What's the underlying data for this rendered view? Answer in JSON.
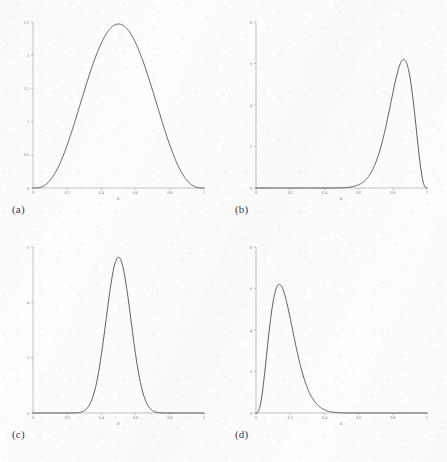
{
  "figure": {
    "background_color": "#fdfdfd",
    "curve_color": "#3c3c3c",
    "axis_color": "#9a9a9a",
    "panel_captions": [
      "(a)",
      "(b)",
      "(c)",
      "(d)"
    ]
  },
  "chart_data": [
    {
      "type": "line",
      "panel": "(a)",
      "title": "",
      "xlabel": "θ",
      "ylabel": "",
      "xlim": [
        0,
        1
      ],
      "ylim": [
        0,
        2.5
      ],
      "xticks": [
        0,
        0.2,
        0.4,
        0.6,
        0.8,
        1
      ],
      "xticklabels": [
        "0",
        "0.2",
        "0.4",
        "0.6",
        "0.8",
        "1"
      ],
      "yticks": [
        0,
        0.5,
        1,
        1.5,
        2,
        2.5
      ],
      "yticklabels": [
        "0",
        "0.5",
        "1",
        "1.5",
        "2",
        "2.5"
      ],
      "grid": false,
      "legend": "none",
      "distribution": "Beta(4, 4)",
      "peak": {
        "x": 0.5,
        "y": 2.47
      },
      "x": [
        0,
        0.02,
        0.04,
        0.06,
        0.08,
        0.1,
        0.12,
        0.14,
        0.16,
        0.18,
        0.2,
        0.22,
        0.24,
        0.26,
        0.28,
        0.3,
        0.32,
        0.34,
        0.36,
        0.38,
        0.4,
        0.42,
        0.44,
        0.46,
        0.48,
        0.5,
        0.52,
        0.54,
        0.56,
        0.58,
        0.6,
        0.62,
        0.64,
        0.66,
        0.68,
        0.7,
        0.72,
        0.74,
        0.76,
        0.78,
        0.8,
        0.82,
        0.84,
        0.86,
        0.88,
        0.9,
        0.92,
        0.94,
        0.96,
        0.98,
        1
      ],
      "y": [
        0,
        0.001,
        0.007,
        0.023,
        0.052,
        0.099,
        0.164,
        0.249,
        0.353,
        0.474,
        0.609,
        0.754,
        0.905,
        1.059,
        1.21,
        1.355,
        1.49,
        1.612,
        1.719,
        1.808,
        1.879,
        1.93,
        1.963,
        1.978,
        1.978,
        1.963,
        1.978,
        1.978,
        1.963,
        1.93,
        1.879,
        1.808,
        1.719,
        1.612,
        1.49,
        1.355,
        1.21,
        1.059,
        0.905,
        0.754,
        0.609,
        0.474,
        0.353,
        0.249,
        0.164,
        0.099,
        0.052,
        0.023,
        0.007,
        0.001,
        0
      ]
    },
    {
      "type": "line",
      "panel": "(b)",
      "title": "",
      "xlabel": "θ",
      "ylabel": "",
      "xlim": [
        0,
        1
      ],
      "ylim": [
        0,
        8
      ],
      "xticks": [
        0,
        0.2,
        0.4,
        0.6,
        0.8,
        1
      ],
      "xticklabels": [
        "0",
        "0.2",
        "0.4",
        "0.6",
        "0.8",
        "1"
      ],
      "yticks": [
        0,
        2,
        4,
        6,
        8
      ],
      "yticklabels": [
        "0",
        "2",
        "4",
        "6",
        "8"
      ],
      "grid": false,
      "legend": "none",
      "distribution": "Beta(20, 4)",
      "peak": {
        "x": 0.865,
        "y": 6.2
      }
    },
    {
      "type": "line",
      "panel": "(c)",
      "title": "",
      "xlabel": "θ",
      "ylabel": "",
      "xlim": [
        0,
        1
      ],
      "ylim": [
        0,
        6
      ],
      "xticks": [
        0,
        0.2,
        0.4,
        0.6,
        0.8,
        1
      ],
      "xticklabels": [
        "0",
        "0.2",
        "0.4",
        "0.6",
        "0.8",
        "1"
      ],
      "yticks": [
        0,
        2,
        4,
        6
      ],
      "yticklabels": [
        "0",
        "2",
        "4",
        "6"
      ],
      "grid": false,
      "legend": "none",
      "distribution": "Beta(25, 25)",
      "peak": {
        "x": 0.5,
        "y": 5.63
      }
    },
    {
      "type": "line",
      "panel": "(d)",
      "title": "",
      "xlabel": "θ",
      "ylabel": "",
      "xlim": [
        0,
        1
      ],
      "ylim": [
        0,
        8
      ],
      "xticks": [
        0,
        0.2,
        0.4,
        0.6,
        0.8,
        1
      ],
      "xticklabels": [
        "0",
        "0.2",
        "0.4",
        "0.6",
        "0.8",
        "1"
      ],
      "yticks": [
        0,
        2,
        4,
        6,
        8
      ],
      "yticklabels": [
        "0",
        "2",
        "4",
        "6",
        "8"
      ],
      "grid": false,
      "legend": "none",
      "distribution": "Beta(4, 20)",
      "peak": {
        "x": 0.145,
        "y": 6.2
      }
    }
  ]
}
